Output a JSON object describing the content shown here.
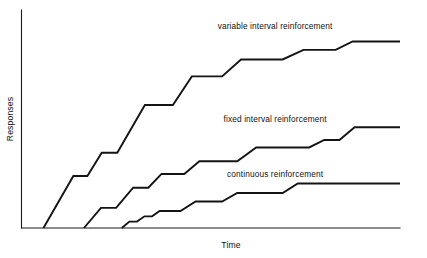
{
  "chart_data": {
    "type": "line",
    "title": "",
    "subtitle": "",
    "xlabel": "Time",
    "ylabel": "Responses",
    "grid": false,
    "legend_position": "inline-right-of-curve",
    "axis": {
      "x_ticks": [],
      "y_ticks": [],
      "xlim": [
        0,
        100
      ],
      "ylim": [
        0,
        100
      ],
      "x_axis_visible": true,
      "y_axis_visible": true,
      "arrowheads": false
    },
    "series": [
      {
        "name": "variable interval reinforcement",
        "label": "variable interval reinforcement",
        "label_position": {
          "x": 67,
          "y": 94
        },
        "color": "#141414",
        "plateau_level": 88,
        "start_x": 5.8,
        "points": [
          {
            "x": 5.8,
            "y": 0
          },
          {
            "x": 13.7,
            "y": 24.5
          },
          {
            "x": 17.4,
            "y": 24.5
          },
          {
            "x": 21.2,
            "y": 35.5
          },
          {
            "x": 25.3,
            "y": 35.5
          },
          {
            "x": 32.6,
            "y": 58.0
          },
          {
            "x": 40.0,
            "y": 58.0
          },
          {
            "x": 45.0,
            "y": 71.5
          },
          {
            "x": 53.0,
            "y": 71.5
          },
          {
            "x": 58.0,
            "y": 79.5
          },
          {
            "x": 69.0,
            "y": 79.5
          },
          {
            "x": 74.5,
            "y": 84.0
          },
          {
            "x": 83.0,
            "y": 84.0
          },
          {
            "x": 87.5,
            "y": 88.0
          },
          {
            "x": 100,
            "y": 88.0
          }
        ]
      },
      {
        "name": "fixed interval reinforcement",
        "label": "fixed interval reinforcement",
        "label_position": {
          "x": 67,
          "y": 50
        },
        "color": "#141414",
        "plateau_level": 47.5,
        "start_x": 16.5,
        "points": [
          {
            "x": 16.5,
            "y": 0
          },
          {
            "x": 21.0,
            "y": 9.5
          },
          {
            "x": 25.0,
            "y": 9.5
          },
          {
            "x": 29.5,
            "y": 19.0
          },
          {
            "x": 33.5,
            "y": 19.0
          },
          {
            "x": 37.0,
            "y": 25.5
          },
          {
            "x": 43.0,
            "y": 25.5
          },
          {
            "x": 47.0,
            "y": 31.5
          },
          {
            "x": 57.0,
            "y": 31.5
          },
          {
            "x": 62.0,
            "y": 38.0
          },
          {
            "x": 76.0,
            "y": 38.0
          },
          {
            "x": 80.0,
            "y": 41.5
          },
          {
            "x": 84.0,
            "y": 41.5
          },
          {
            "x": 88.0,
            "y": 47.5
          },
          {
            "x": 100,
            "y": 47.5
          }
        ]
      },
      {
        "name": "continuous reinforcement",
        "label": "continuous reinforcement",
        "label_position": {
          "x": 67,
          "y": 24
        },
        "color": "#141414",
        "plateau_level": 21.0,
        "start_x": 26.5,
        "points": [
          {
            "x": 26.5,
            "y": 0
          },
          {
            "x": 28.5,
            "y": 3.0
          },
          {
            "x": 30.5,
            "y": 3.0
          },
          {
            "x": 32.5,
            "y": 5.5
          },
          {
            "x": 34.5,
            "y": 5.5
          },
          {
            "x": 36.5,
            "y": 8.0
          },
          {
            "x": 42.0,
            "y": 8.0
          },
          {
            "x": 46.0,
            "y": 12.5
          },
          {
            "x": 53.0,
            "y": 12.5
          },
          {
            "x": 57.0,
            "y": 16.5
          },
          {
            "x": 69.0,
            "y": 16.5
          },
          {
            "x": 73.0,
            "y": 21.0
          },
          {
            "x": 100,
            "y": 21.0
          }
        ]
      }
    ]
  },
  "labels": {
    "y_axis_title": "Responses",
    "x_axis_title": "Time",
    "curve_top": "variable interval reinforcement",
    "curve_middle": "fixed interval reinforcement",
    "curve_bottom": "continuous reinforcement"
  },
  "colors": {
    "background": "#ffffff",
    "ink": "#141414",
    "axis": "#1a1a1a"
  }
}
